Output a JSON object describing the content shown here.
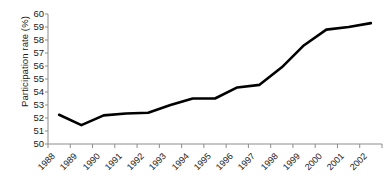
{
  "chart_data": {
    "type": "line",
    "title": "",
    "subtitle": "",
    "xlabel": "",
    "ylabel": "Participation rate (%)",
    "categories": [
      "1988",
      "1989",
      "1990",
      "1991",
      "1992",
      "1993",
      "1994",
      "1995",
      "1996",
      "1997",
      "1998",
      "1999",
      "2000",
      "2001",
      "2002"
    ],
    "values": [
      52.25,
      51.45,
      52.2,
      52.35,
      52.4,
      53.0,
      53.5,
      53.5,
      54.35,
      54.55,
      55.9,
      57.6,
      58.8,
      59.0,
      59.3
    ],
    "ylim": [
      50,
      60
    ],
    "ytick_labels": [
      "60",
      "59",
      "58",
      "57",
      "56",
      "55",
      "54",
      "53",
      "52",
      "51",
      "50"
    ],
    "ytick_values": [
      60,
      59,
      58,
      57,
      56,
      55,
      54,
      53,
      52,
      51,
      50
    ],
    "ytick_step": 1,
    "xlim": [
      "1988",
      "2002"
    ],
    "grid": false,
    "legend": null,
    "legend_position": "none",
    "series_color": "#000000",
    "axis_color": "#8c8c8c",
    "text_color": "#1a1a1a",
    "background": "#ffffff",
    "line_width": 2.6,
    "markers": false
  }
}
